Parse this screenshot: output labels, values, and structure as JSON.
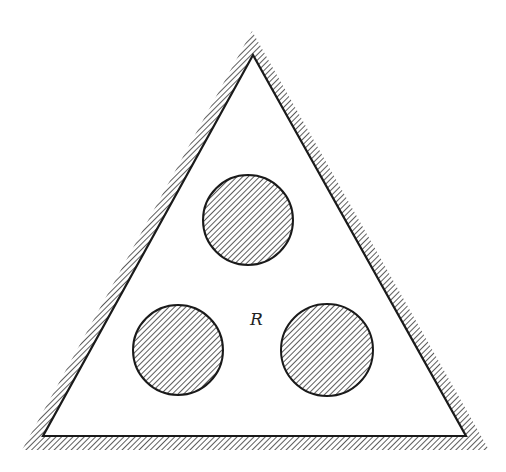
{
  "figure": {
    "region_label": "R",
    "colors": {
      "stroke": "#1a1a1a",
      "hatch": "#333333",
      "background": "#ffffff"
    },
    "triangle": {
      "inner": [
        [
          253,
          55
        ],
        [
          43,
          436
        ],
        [
          466,
          436
        ]
      ],
      "outer": [
        [
          252,
          31
        ],
        [
          22,
          450
        ],
        [
          489,
          450
        ]
      ]
    },
    "holes": [
      {
        "name": "top",
        "cx": 248,
        "cy": 220,
        "r": 45
      },
      {
        "name": "left",
        "cx": 178,
        "cy": 350,
        "r": 45
      },
      {
        "name": "right",
        "cx": 327,
        "cy": 350,
        "r": 46
      }
    ],
    "label_position": [
      258,
      324
    ]
  }
}
